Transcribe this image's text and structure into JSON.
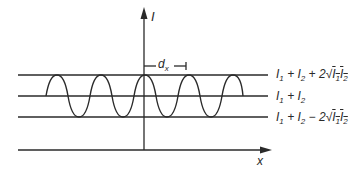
{
  "diagram": {
    "axes": {
      "y_label": "I",
      "x_label": "x"
    },
    "fringe_spacing_label": "d_x",
    "levels": [
      {
        "name": "maximum",
        "label": "I1 + I2 + 2√(I1 I2)"
      },
      {
        "name": "mean",
        "label": "I1 + I2"
      },
      {
        "name": "minimum",
        "label": "I1 + I2 − 2√(I1 I2)"
      }
    ],
    "wave": {
      "type": "sinusoid",
      "peaks_visible": 5,
      "peak_at_origin": true
    },
    "colors": {
      "line": "#2a2a2a",
      "background": "#ffffff"
    }
  },
  "labels": {
    "y_axis": "I",
    "x_axis": "x",
    "dx_main": "d",
    "dx_sub": "x",
    "max_parts": [
      "I",
      "1",
      " + I",
      "2",
      " + 2",
      "I",
      "1",
      "I",
      "2"
    ],
    "mean_parts": [
      "I",
      "1",
      " + I",
      "2"
    ],
    "min_parts": [
      "I",
      "1",
      " + I",
      "2",
      " − 2",
      "I",
      "1",
      "I",
      "2"
    ]
  }
}
